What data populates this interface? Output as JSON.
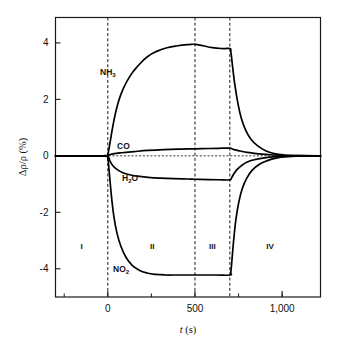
{
  "chart_data": {
    "type": "line",
    "title": "",
    "xlabel": "t (s)",
    "ylabel": "Δρ/ρ (%)",
    "xlim": [
      -300,
      1220
    ],
    "ylim": [
      -5.0,
      4.9
    ],
    "xticks": [
      0,
      500,
      1000
    ],
    "xtick_labels": [
      "0",
      "500",
      "1,000"
    ],
    "xticks_minor": [
      -250,
      250,
      750,
      1000
    ],
    "yticks": [
      4,
      2,
      0,
      -2,
      -4
    ],
    "ytick_labels": [
      "4",
      "2",
      "0",
      "-2",
      "-4"
    ],
    "grid": false,
    "legend": "inline-annotations",
    "zero_reference_line": 0,
    "region_dividers": [
      0,
      500,
      700
    ],
    "regions": [
      {
        "label": "I",
        "x_center": -150,
        "y": -3.3
      },
      {
        "label": "II",
        "x_center": 255,
        "y": -3.3
      },
      {
        "label": "III",
        "x_center": 600,
        "y": -3.3
      },
      {
        "label": "IV",
        "x_center": 930,
        "y": -3.3
      }
    ],
    "annotations": [
      {
        "text": "NH",
        "sub": "3",
        "x": 100,
        "y": 2.55
      },
      {
        "text": "CO",
        "sub": "",
        "x": 150,
        "y": 0.62
      },
      {
        "text": "H",
        "sub": "2",
        "text2": "O",
        "x": 185,
        "y": -1.08
      },
      {
        "text": "NO",
        "sub": "2",
        "x": 170,
        "y": -4.25
      }
    ],
    "series": [
      {
        "name": "NH3",
        "points": [
          [
            -300,
            0.0
          ],
          [
            -60,
            0.0
          ],
          [
            -10,
            0.0
          ],
          [
            0,
            0.05
          ],
          [
            15,
            0.55
          ],
          [
            35,
            1.25
          ],
          [
            60,
            1.9
          ],
          [
            90,
            2.4
          ],
          [
            130,
            2.85
          ],
          [
            175,
            3.2
          ],
          [
            225,
            3.5
          ],
          [
            280,
            3.7
          ],
          [
            340,
            3.83
          ],
          [
            400,
            3.9
          ],
          [
            460,
            3.94
          ],
          [
            500,
            3.95
          ],
          [
            545,
            3.9
          ],
          [
            600,
            3.83
          ],
          [
            660,
            3.8
          ],
          [
            700,
            3.8
          ],
          [
            706,
            3.68
          ],
          [
            715,
            3.2
          ],
          [
            728,
            2.55
          ],
          [
            745,
            1.9
          ],
          [
            765,
            1.35
          ],
          [
            790,
            0.92
          ],
          [
            820,
            0.6
          ],
          [
            860,
            0.35
          ],
          [
            905,
            0.18
          ],
          [
            955,
            0.08
          ],
          [
            1010,
            0.03
          ],
          [
            1080,
            0.01
          ],
          [
            1220,
            0.0
          ]
        ]
      },
      {
        "name": "CO",
        "points": [
          [
            -300,
            0.0
          ],
          [
            -50,
            0.0
          ],
          [
            0,
            0.02
          ],
          [
            30,
            0.07
          ],
          [
            80,
            0.11
          ],
          [
            150,
            0.15
          ],
          [
            230,
            0.19
          ],
          [
            320,
            0.22
          ],
          [
            420,
            0.24
          ],
          [
            500,
            0.25
          ],
          [
            580,
            0.26
          ],
          [
            660,
            0.27
          ],
          [
            700,
            0.27
          ],
          [
            712,
            0.25
          ],
          [
            730,
            0.21
          ],
          [
            760,
            0.17
          ],
          [
            800,
            0.12
          ],
          [
            850,
            0.08
          ],
          [
            910,
            0.05
          ],
          [
            975,
            0.02
          ],
          [
            1050,
            0.01
          ],
          [
            1220,
            0.0
          ]
        ]
      },
      {
        "name": "H2O",
        "points": [
          [
            -300,
            0.0
          ],
          [
            -50,
            0.0
          ],
          [
            0,
            -0.03
          ],
          [
            12,
            -0.18
          ],
          [
            28,
            -0.34
          ],
          [
            50,
            -0.47
          ],
          [
            80,
            -0.58
          ],
          [
            120,
            -0.66
          ],
          [
            170,
            -0.72
          ],
          [
            230,
            -0.76
          ],
          [
            300,
            -0.79
          ],
          [
            380,
            -0.81
          ],
          [
            460,
            -0.82
          ],
          [
            500,
            -0.83
          ],
          [
            580,
            -0.84
          ],
          [
            660,
            -0.85
          ],
          [
            700,
            -0.85
          ],
          [
            710,
            -0.78
          ],
          [
            725,
            -0.62
          ],
          [
            745,
            -0.46
          ],
          [
            770,
            -0.33
          ],
          [
            800,
            -0.22
          ],
          [
            840,
            -0.14
          ],
          [
            890,
            -0.08
          ],
          [
            945,
            -0.04
          ],
          [
            1010,
            -0.02
          ],
          [
            1090,
            -0.01
          ],
          [
            1220,
            0.0
          ]
        ]
      },
      {
        "name": "NO2",
        "points": [
          [
            -300,
            0.0
          ],
          [
            -60,
            0.0
          ],
          [
            -10,
            0.0
          ],
          [
            0,
            -0.08
          ],
          [
            10,
            -0.7
          ],
          [
            22,
            -1.5
          ],
          [
            35,
            -2.15
          ],
          [
            52,
            -2.72
          ],
          [
            75,
            -3.2
          ],
          [
            105,
            -3.6
          ],
          [
            140,
            -3.88
          ],
          [
            180,
            -4.05
          ],
          [
            225,
            -4.15
          ],
          [
            275,
            -4.2
          ],
          [
            330,
            -4.22
          ],
          [
            400,
            -4.22
          ],
          [
            470,
            -4.22
          ],
          [
            540,
            -4.22
          ],
          [
            620,
            -4.22
          ],
          [
            700,
            -4.22
          ],
          [
            706,
            -4.1
          ],
          [
            714,
            -3.55
          ],
          [
            724,
            -2.85
          ],
          [
            736,
            -2.2
          ],
          [
            752,
            -1.62
          ],
          [
            772,
            -1.15
          ],
          [
            798,
            -0.78
          ],
          [
            830,
            -0.5
          ],
          [
            870,
            -0.3
          ],
          [
            915,
            -0.17
          ],
          [
            965,
            -0.08
          ],
          [
            1025,
            -0.03
          ],
          [
            1100,
            -0.01
          ],
          [
            1220,
            0.0
          ]
        ]
      }
    ]
  },
  "axes": {
    "y_label": "Δρ/ρ (%)",
    "x_label_italic": "t",
    "x_label_unit": " (s)"
  },
  "labels": {
    "nh3_main": "NH",
    "nh3_sub": "3",
    "co": "CO",
    "h2o_main": "H",
    "h2o_sub": "2",
    "h2o_tail": "O",
    "no2_main": "NO",
    "no2_sub": "2",
    "region_1": "I",
    "region_2": "II",
    "region_3": "III",
    "region_4": "IV",
    "ytick_4": "4",
    "ytick_2": "2",
    "ytick_0": "0",
    "ytick_m2": "-2",
    "ytick_m4": "-4",
    "xtick_0": "0",
    "xtick_500": "500",
    "xtick_1000": "1,000"
  }
}
